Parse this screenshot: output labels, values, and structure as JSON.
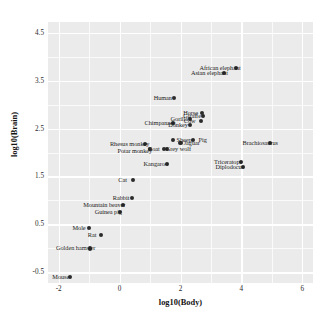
{
  "chart_data": {
    "type": "scatter",
    "title": "",
    "xlabel": "log10(Body)",
    "ylabel": "log10(Brain)",
    "xlim": [
      -2.35,
      6.35
    ],
    "ylim": [
      -0.72,
      4.72
    ],
    "xticks": [
      "-2",
      "0",
      "2",
      "4",
      "6"
    ],
    "xtick_values": [
      -2,
      0,
      2,
      4,
      6
    ],
    "yticks": [
      "-0.5",
      "0.5",
      "1.5",
      "2.5",
      "3.5",
      "4.5"
    ],
    "ytick_values": [
      -0.5,
      0.5,
      1.5,
      2.5,
      3.5,
      4.5
    ],
    "grid": true,
    "grid_major_color": "#ffffff",
    "panel_color": "#ebebeb",
    "point_color": "#2b2b2b",
    "legend": "none",
    "points": [
      {
        "label": "Mountain beaver",
        "x": 0.114,
        "y": 0.903,
        "lx": -0.5,
        "ly": 0.903
      },
      {
        "label": "Cow",
        "x": 2.666,
        "y": 2.663,
        "lx": 2.3,
        "ly": 2.663
      },
      {
        "label": "Grey wolf",
        "x": 1.568,
        "y": 2.079,
        "lx": 1.93,
        "ly": 2.079
      },
      {
        "label": "Goat",
        "x": 1.447,
        "y": 2.079,
        "lx": 1.12,
        "ly": 2.079
      },
      {
        "label": "Guinea pig",
        "x": 0.021,
        "y": 0.763,
        "lx": -0.37,
        "ly": 0.763
      },
      {
        "label": "Diplodocus",
        "x": 4.041,
        "y": 1.699,
        "lx": 3.62,
        "ly": 1.699
      },
      {
        "label": "Asian elephant",
        "x": 3.425,
        "y": 3.663,
        "lx": 2.95,
        "ly": 3.663
      },
      {
        "label": "Donkey",
        "x": 2.301,
        "y": 2.574,
        "lx": 1.92,
        "ly": 2.574
      },
      {
        "label": "Horse",
        "x": 2.699,
        "y": 2.819,
        "lx": 2.33,
        "ly": 2.819
      },
      {
        "label": "Potar monkey",
        "x": 1.0,
        "y": 2.079,
        "lx": 0.5,
        "ly": 2.04
      },
      {
        "label": "Cat",
        "x": 0.431,
        "y": 1.431,
        "lx": 0.1,
        "ly": 1.431
      },
      {
        "label": "Giraffe",
        "x": 2.74,
        "y": 2.763,
        "lx": 2.38,
        "ly": 2.763
      },
      {
        "label": "Gorilla",
        "x": 2.322,
        "y": 2.699,
        "lx": 1.96,
        "ly": 2.699
      },
      {
        "label": "Human",
        "x": 1.778,
        "y": 3.128,
        "lx": 1.42,
        "ly": 3.128
      },
      {
        "label": "African elephant",
        "x": 3.826,
        "y": 3.766,
        "lx": 3.3,
        "ly": 3.766
      },
      {
        "label": "Triceratops",
        "x": 3.997,
        "y": 1.806,
        "lx": 3.56,
        "ly": 1.806
      },
      {
        "label": "Rhesus monkey",
        "x": 0.826,
        "y": 2.176,
        "lx": 0.33,
        "ly": 2.176
      },
      {
        "label": "Kangaroo",
        "x": 1.544,
        "y": 1.756,
        "lx": 1.19,
        "ly": 1.756
      },
      {
        "label": "Golden hamster",
        "x": -0.959,
        "y": 0.0,
        "lx": -1.44,
        "ly": 0.0
      },
      {
        "label": "Mouse",
        "x": -1.638,
        "y": -0.602,
        "lx": -1.93,
        "ly": -0.602
      },
      {
        "label": "Rabbit",
        "x": 0.398,
        "y": 1.057,
        "lx": 0.05,
        "ly": 1.057
      },
      {
        "label": "Sheep",
        "x": 1.748,
        "y": 2.255,
        "lx": 2.12,
        "ly": 2.255
      },
      {
        "label": "Jaguar",
        "x": 2.0,
        "y": 2.204,
        "lx": 2.37,
        "ly": 2.204
      },
      {
        "label": "Chimpanzee",
        "x": 1.748,
        "y": 2.613,
        "lx": 1.33,
        "ly": 2.613
      },
      {
        "label": "Brachiosaurus",
        "x": 4.944,
        "y": 2.204,
        "lx": 4.62,
        "ly": 2.204
      },
      {
        "label": "Mole",
        "x": -1.0,
        "y": 0.431,
        "lx": -1.33,
        "ly": 0.431
      },
      {
        "label": "Pig",
        "x": 2.398,
        "y": 2.255,
        "lx": 2.73,
        "ly": 2.255
      },
      {
        "label": "Rat",
        "x": -0.6,
        "y": 0.279,
        "lx": -0.9,
        "ly": 0.279
      }
    ]
  }
}
